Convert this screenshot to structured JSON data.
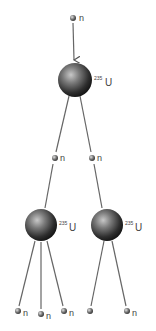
{
  "diagram": {
    "type": "nuclear-fission-chain-reaction",
    "nucleus_label": {
      "mass_number": "235",
      "symbol": "U"
    },
    "neutron_label": "n",
    "nodes": [
      {
        "id": "n0",
        "kind": "neutron",
        "x": 73,
        "y": 18,
        "label": "n"
      },
      {
        "id": "u1",
        "kind": "nucleus",
        "x": 75,
        "y": 80,
        "r": 17,
        "label": "235U"
      },
      {
        "id": "n1",
        "kind": "neutron",
        "x": 55,
        "y": 158,
        "label": "n"
      },
      {
        "id": "n2",
        "kind": "neutron",
        "x": 92,
        "y": 158,
        "label": "n"
      },
      {
        "id": "u2",
        "kind": "nucleus",
        "x": 41,
        "y": 225,
        "r": 16,
        "label": "235U"
      },
      {
        "id": "u3",
        "kind": "nucleus",
        "x": 107,
        "y": 225,
        "r": 16,
        "label": "235U"
      },
      {
        "id": "n3",
        "kind": "neutron",
        "x": 18,
        "y": 311,
        "label": "n"
      },
      {
        "id": "n4",
        "kind": "neutron",
        "x": 41,
        "y": 314,
        "label": "n"
      },
      {
        "id": "n5",
        "kind": "neutron",
        "x": 64,
        "y": 311,
        "label": "n"
      },
      {
        "id": "n6",
        "kind": "neutron",
        "x": 90,
        "y": 311,
        "label": ""
      },
      {
        "id": "n7",
        "kind": "neutron",
        "x": 127,
        "y": 311,
        "label": "n"
      }
    ],
    "edges": [
      {
        "from": "n0",
        "to": "u1",
        "arrow": true
      },
      {
        "from": "u1",
        "to": "n1"
      },
      {
        "from": "n1",
        "to": "u2"
      },
      {
        "from": "u1",
        "to": "n2"
      },
      {
        "from": "n2",
        "to": "u3"
      },
      {
        "from": "u2",
        "to": "n3"
      },
      {
        "from": "u2",
        "to": "n4"
      },
      {
        "from": "u2",
        "to": "n5"
      },
      {
        "from": "u3",
        "to": "n6"
      },
      {
        "from": "u3",
        "to": "n7"
      }
    ]
  },
  "labels": {
    "n0": "n",
    "u1_mass": "235",
    "u1_sym": "U",
    "n1": "n",
    "n2": "n",
    "u2_mass": "235",
    "u2_sym": "U",
    "u3_mass": "235",
    "u3_sym": "U",
    "n3": "n",
    "n4": "n",
    "n5": "n",
    "n7": "n"
  }
}
